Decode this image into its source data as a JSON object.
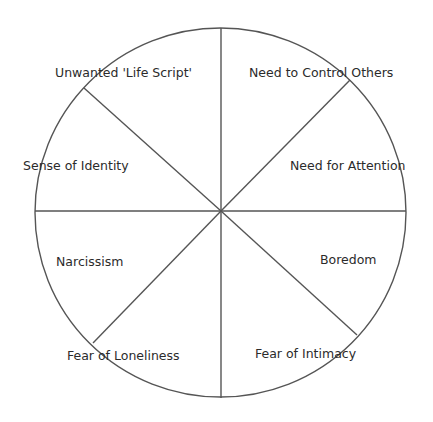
{
  "diagram": {
    "type": "segmented-circle",
    "segment_count": 8,
    "line_color": "#555555",
    "text_color": "#2b2b2b",
    "background": "#ffffff",
    "segments": [
      {
        "position": "top-left",
        "label": "Unwanted 'Life Script'"
      },
      {
        "position": "top-right",
        "label": "Need to Control Others"
      },
      {
        "position": "upper-left",
        "label": "Sense of Identity"
      },
      {
        "position": "upper-right",
        "label": "Need for Attention"
      },
      {
        "position": "lower-left",
        "label": "Narcissism"
      },
      {
        "position": "lower-right",
        "label": "Boredom"
      },
      {
        "position": "bottom-left",
        "label": "Fear of Loneliness"
      },
      {
        "position": "bottom-right",
        "label": "Fear of Intimacy"
      }
    ]
  }
}
